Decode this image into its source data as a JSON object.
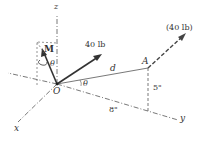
{
  "diagram": {
    "axes": {
      "x": "x",
      "y": "y",
      "z": "z"
    },
    "origin": "O",
    "point_A": "A",
    "force_label": "40 lb",
    "force_at_A_label": "(40 lb)",
    "moment_label": "M",
    "angle_label_1": "θ",
    "angle_label_2": "θ",
    "distance_label": "d",
    "dim_vertical": "5\"",
    "dim_horizontal": "8\""
  }
}
